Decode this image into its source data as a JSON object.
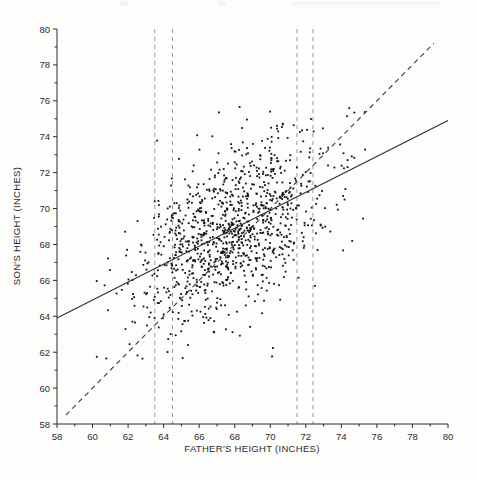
{
  "figure": {
    "background_color": "#fdfdfc",
    "point_color": "#111111",
    "line_color": "#333333",
    "gridline_color": "#9a9a9a"
  },
  "chart_data": {
    "type": "scatter",
    "title": "",
    "xlabel": "FATHER'S HEIGHT (INCHES)",
    "ylabel": "SON'S HEIGHT (INCHES)",
    "xlim": [
      58,
      80
    ],
    "ylim": [
      58,
      80
    ],
    "xticks": [
      58,
      60,
      62,
      64,
      66,
      68,
      70,
      72,
      74,
      76,
      78,
      80
    ],
    "yticks": [
      58,
      60,
      62,
      64,
      66,
      68,
      70,
      72,
      74,
      76,
      78,
      80
    ],
    "xtick_labels": [
      "58",
      "60",
      "62",
      "64",
      "66",
      "68",
      "70",
      "72",
      "74",
      "76",
      "78",
      "80"
    ],
    "ytick_labels": [
      "58",
      "60",
      "62",
      "64",
      "66",
      "68",
      "70",
      "72",
      "74",
      "76",
      "78",
      "80"
    ],
    "minor_tick_step": 1,
    "grid": false,
    "legend": null,
    "annotations": [],
    "vertical_reference_lines": {
      "style": "dashed",
      "color": "#9a9a9a",
      "x_values": [
        63.5,
        64.5,
        71.5,
        72.4
      ]
    },
    "lines": [
      {
        "name": "regression-line",
        "style": "solid",
        "x": [
          58,
          80
        ],
        "y": [
          63.9,
          74.9
        ],
        "slope": 0.5,
        "intercept": 34.9
      },
      {
        "name": "identity-line",
        "style": "dashed",
        "x": [
          58.5,
          79.2
        ],
        "y": [
          58.5,
          79.2
        ],
        "slope": 1,
        "intercept": 0
      }
    ],
    "series": [
      {
        "name": "father-son-heights",
        "marker": "dot",
        "n_points": 1078,
        "x_range": [
          59.0,
          75.4
        ],
        "y_range": [
          58.5,
          78.4
        ],
        "mean_x": 67.7,
        "mean_y": 68.7,
        "correlation": 0.5
      }
    ]
  }
}
